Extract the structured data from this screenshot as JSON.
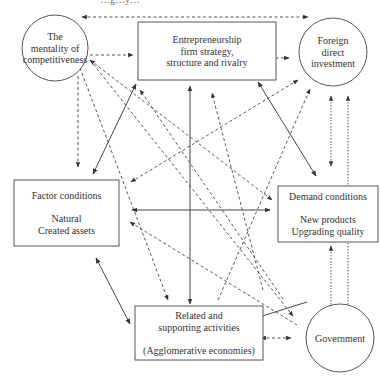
{
  "caption": "…g…y…",
  "nodes": {
    "mentality": {
      "shape": "circle",
      "lines": [
        "The",
        "mentality of",
        "competitiveness"
      ]
    },
    "entrepreneurship": {
      "shape": "box",
      "lines": [
        "Entrepreneurship",
        "firm strategy,",
        "structure and rivalry"
      ]
    },
    "fdi": {
      "shape": "circle",
      "lines": [
        "Foreign",
        "direct",
        "investment"
      ]
    },
    "factor": {
      "shape": "box",
      "lines": [
        "Factor conditions",
        "",
        "Natural",
        "Created assets"
      ]
    },
    "demand": {
      "shape": "box",
      "lines": [
        "Demand conditions",
        "",
        "New products",
        "Upgrading quality"
      ]
    },
    "related": {
      "shape": "box",
      "lines": [
        "Related and",
        "supporting activities",
        "",
        "(Agglomerative economies)"
      ]
    },
    "government": {
      "shape": "circle",
      "lines": [
        "Government"
      ]
    }
  },
  "edges": [
    {
      "from": "mentality",
      "to": "fdi",
      "style": "dashed",
      "direction": "both",
      "route": "top"
    },
    {
      "from": "mentality",
      "to": "entrepreneurship",
      "style": "dashed",
      "direction": "forward"
    },
    {
      "from": "entrepreneurship",
      "to": "fdi",
      "style": "dashed",
      "direction": "both"
    },
    {
      "from": "mentality",
      "to": "factor",
      "style": "dashed",
      "direction": "forward"
    },
    {
      "from": "factor",
      "to": "entrepreneurship",
      "style": "solid",
      "direction": "both"
    },
    {
      "from": "entrepreneurship",
      "to": "related",
      "style": "solid",
      "direction": "both"
    },
    {
      "from": "entrepreneurship",
      "to": "demand",
      "style": "solid",
      "direction": "both"
    },
    {
      "from": "factor",
      "to": "demand",
      "style": "solid",
      "direction": "both"
    },
    {
      "from": "factor",
      "to": "related",
      "style": "solid",
      "direction": "both"
    },
    {
      "from": "related",
      "to": "government",
      "style": "dashed",
      "direction": "both"
    },
    {
      "from": "demand",
      "to": "related",
      "style": "solid",
      "direction": "forward"
    },
    {
      "from": "mentality",
      "to": "demand",
      "style": "dashed",
      "direction": "both"
    },
    {
      "from": "mentality",
      "to": "government",
      "style": "dashed",
      "direction": "forward"
    },
    {
      "from": "mentality",
      "to": "related",
      "style": "dashed",
      "direction": "forward"
    },
    {
      "from": "factor",
      "to": "fdi",
      "style": "dashed",
      "direction": "both"
    },
    {
      "from": "related",
      "to": "fdi",
      "style": "dashed",
      "direction": "forward"
    },
    {
      "from": "related",
      "to": "entrepreneurship",
      "style": "dashed",
      "direction": "forward"
    },
    {
      "from": "government",
      "to": "factor",
      "style": "dashed",
      "direction": "forward"
    },
    {
      "from": "government",
      "to": "entrepreneurship",
      "style": "dashed",
      "direction": "forward"
    },
    {
      "from": "fdi",
      "to": "demand",
      "style": "dotted",
      "direction": "both"
    },
    {
      "from": "government",
      "to": "fdi",
      "style": "dotted",
      "direction": "both"
    },
    {
      "from": "demand",
      "to": "government",
      "style": "dotted",
      "direction": "both"
    }
  ]
}
